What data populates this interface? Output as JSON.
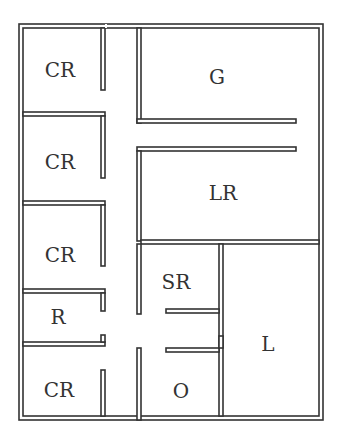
{
  "diagram": {
    "type": "floor-plan",
    "wall_color": "#333333",
    "background": "#ffffff",
    "rooms": [
      {
        "id": "cr1",
        "label": "CR",
        "x": 60,
        "y": 70
      },
      {
        "id": "cr2",
        "label": "CR",
        "x": 60,
        "y": 163
      },
      {
        "id": "cr3",
        "label": "CR",
        "x": 60,
        "y": 255
      },
      {
        "id": "r",
        "label": "R",
        "x": 58,
        "y": 318
      },
      {
        "id": "cr4",
        "label": "CR",
        "x": 59,
        "y": 390
      },
      {
        "id": "g",
        "label": "G",
        "x": 217,
        "y": 78
      },
      {
        "id": "lr",
        "label": "LR",
        "x": 223,
        "y": 194
      },
      {
        "id": "sr",
        "label": "SR",
        "x": 175,
        "y": 283
      },
      {
        "id": "l",
        "label": "L",
        "x": 268,
        "y": 345
      },
      {
        "id": "o",
        "label": "O",
        "x": 181,
        "y": 392
      }
    ]
  }
}
